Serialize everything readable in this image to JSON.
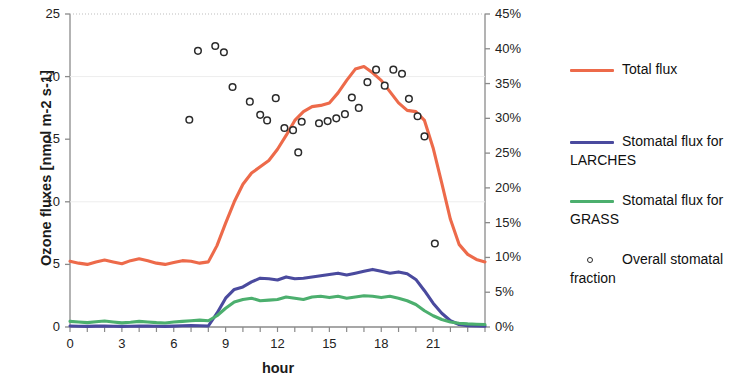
{
  "chart_data": {
    "type": "line",
    "title": "",
    "xlabel": "hour",
    "ylabel": "Ozone fluxes [nmol m-2 s-1]",
    "y2label": "",
    "xlim": [
      0,
      24
    ],
    "ylim": [
      0,
      25
    ],
    "y2lim": [
      0,
      45
    ],
    "xticks": [
      0,
      3,
      6,
      9,
      12,
      15,
      18,
      21
    ],
    "xtick_labels": [
      "0",
      "3",
      "6",
      "9",
      "12",
      "15",
      "18",
      "21"
    ],
    "yticks": [
      0,
      5,
      10,
      15,
      20,
      25
    ],
    "ytick_labels": [
      "0",
      "5",
      "10",
      "15",
      "20",
      "25"
    ],
    "y2ticks": [
      0,
      5,
      10,
      15,
      20,
      25,
      30,
      35,
      40,
      45
    ],
    "y2tick_labels": [
      "0%",
      "5%",
      "10%",
      "15%",
      "20%",
      "25%",
      "30%",
      "35%",
      "40%",
      "45%"
    ],
    "grid": false,
    "legend_position": "right",
    "x": [
      0,
      0.5,
      1,
      1.5,
      2,
      2.5,
      3,
      3.5,
      4,
      4.5,
      5,
      5.5,
      6,
      6.5,
      7,
      7.5,
      8,
      8.5,
      9,
      9.5,
      10,
      10.5,
      11,
      11.5,
      12,
      12.5,
      13,
      13.5,
      14,
      14.5,
      15,
      15.5,
      16,
      16.5,
      17,
      17.5,
      18,
      18.5,
      19,
      19.5,
      20,
      20.5,
      21,
      21.5,
      22,
      22.5,
      23,
      23.5,
      24
    ],
    "series": [
      {
        "name": "Total flux",
        "color": "#ED6A4A",
        "axis": "left",
        "values": [
          5.25,
          5.1,
          5.0,
          5.2,
          5.35,
          5.2,
          5.05,
          5.3,
          5.45,
          5.3,
          5.1,
          5.0,
          5.15,
          5.3,
          5.25,
          5.1,
          5.2,
          6.5,
          8.3,
          10.0,
          11.4,
          12.3,
          12.8,
          13.3,
          14.2,
          15.3,
          16.5,
          17.2,
          17.6,
          17.7,
          17.9,
          18.7,
          19.7,
          20.6,
          20.8,
          20.3,
          19.7,
          18.8,
          17.9,
          17.3,
          17.2,
          16.5,
          14.3,
          11.5,
          8.6,
          6.6,
          5.8,
          5.4,
          5.2
        ]
      },
      {
        "name": "Stomatal flux for LARCHES",
        "color": "#4A4A9E",
        "axis": "left",
        "values": [
          0.08,
          0.06,
          0.05,
          0.07,
          0.08,
          0.06,
          0.05,
          0.06,
          0.08,
          0.07,
          0.06,
          0.05,
          0.07,
          0.1,
          0.12,
          0.1,
          0.08,
          1.1,
          2.3,
          3.0,
          3.2,
          3.6,
          3.9,
          3.85,
          3.75,
          4.0,
          3.85,
          3.9,
          4.0,
          4.1,
          4.2,
          4.3,
          4.15,
          4.3,
          4.45,
          4.6,
          4.45,
          4.3,
          4.4,
          4.25,
          3.8,
          2.9,
          1.9,
          1.1,
          0.5,
          0.2,
          0.1,
          0.08,
          0.07
        ]
      },
      {
        "name": "Stomatal flux for GRASS",
        "color": "#4CAF6E",
        "axis": "left",
        "values": [
          0.45,
          0.4,
          0.35,
          0.42,
          0.48,
          0.4,
          0.33,
          0.38,
          0.45,
          0.4,
          0.35,
          0.32,
          0.4,
          0.45,
          0.5,
          0.55,
          0.5,
          0.9,
          1.5,
          2.0,
          2.2,
          2.3,
          2.1,
          2.15,
          2.2,
          2.4,
          2.3,
          2.2,
          2.4,
          2.45,
          2.35,
          2.45,
          2.3,
          2.4,
          2.5,
          2.45,
          2.35,
          2.45,
          2.3,
          2.1,
          1.8,
          1.3,
          0.9,
          0.6,
          0.4,
          0.3,
          0.25,
          0.22,
          0.2
        ]
      }
    ],
    "scatter": {
      "name": "Overall stomatal fraction",
      "marker": "open-circle",
      "color": "#2b2b2b",
      "axis": "right",
      "points": [
        {
          "x": 6.9,
          "y": 29.8
        },
        {
          "x": 7.4,
          "y": 39.7
        },
        {
          "x": 8.4,
          "y": 40.4
        },
        {
          "x": 8.9,
          "y": 39.5
        },
        {
          "x": 9.4,
          "y": 34.5
        },
        {
          "x": 10.4,
          "y": 32.4
        },
        {
          "x": 11.0,
          "y": 30.5
        },
        {
          "x": 11.4,
          "y": 29.7
        },
        {
          "x": 11.9,
          "y": 32.9
        },
        {
          "x": 12.4,
          "y": 28.6
        },
        {
          "x": 12.9,
          "y": 28.3
        },
        {
          "x": 13.4,
          "y": 29.5
        },
        {
          "x": 13.2,
          "y": 25.1
        },
        {
          "x": 14.4,
          "y": 29.3
        },
        {
          "x": 14.9,
          "y": 29.6
        },
        {
          "x": 15.4,
          "y": 30.0
        },
        {
          "x": 15.9,
          "y": 30.6
        },
        {
          "x": 16.3,
          "y": 33.0
        },
        {
          "x": 16.7,
          "y": 31.5
        },
        {
          "x": 17.2,
          "y": 35.2
        },
        {
          "x": 17.7,
          "y": 37.0
        },
        {
          "x": 18.2,
          "y": 34.7
        },
        {
          "x": 18.7,
          "y": 37.0
        },
        {
          "x": 19.2,
          "y": 36.4
        },
        {
          "x": 19.6,
          "y": 32.8
        },
        {
          "x": 20.1,
          "y": 30.3
        },
        {
          "x": 20.5,
          "y": 27.4
        },
        {
          "x": 21.1,
          "y": 12.0
        }
      ]
    }
  },
  "legend": {
    "items": [
      {
        "label": "Total flux",
        "type": "line",
        "color": "#ED6A4A"
      },
      {
        "label": "Stomatal flux for LARCHES",
        "type": "line",
        "color": "#4A4A9E"
      },
      {
        "label": "Stomatal flux for GRASS",
        "type": "line",
        "color": "#4CAF6E"
      },
      {
        "label": "Overall stomatal fraction",
        "type": "marker",
        "color": "#2b2b2b"
      }
    ]
  }
}
